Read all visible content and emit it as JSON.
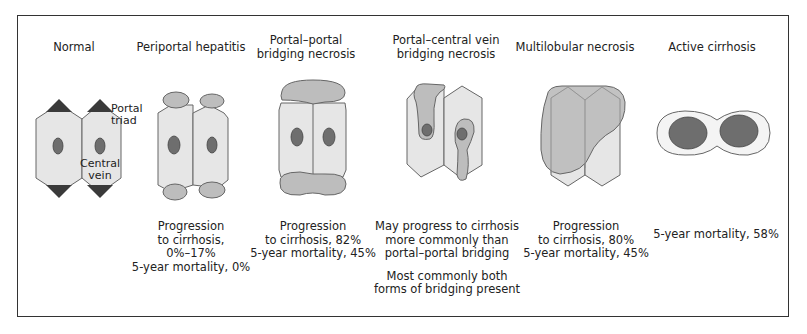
{
  "figure": {
    "stages": [
      {
        "id": "normal",
        "title": "Normal",
        "labels": {
          "portal_triad": "Portal\ntriad",
          "central_vein": "Central\nvein"
        },
        "caption": []
      },
      {
        "id": "periportal-hepatitis",
        "title": "Periportal hepatitis",
        "caption": [
          "Progression",
          "to cirrhosis,",
          "0%–17%",
          "5-year mortality, 0%"
        ]
      },
      {
        "id": "portal-portal-bridging-necrosis",
        "title": "Portal–portal\nbridging necrosis",
        "caption": [
          "Progression",
          "to cirrhosis, 82%",
          "5-year mortality, 45%"
        ]
      },
      {
        "id": "portal-central-vein-bridging-necrosis",
        "title": "Portal–central vein\nbridging necrosis",
        "caption": [
          "May progress to cirrhosis",
          "more commonly than",
          "portal–portal bridging",
          "",
          "Most commonly both",
          "forms of bridging present"
        ]
      },
      {
        "id": "multilobular-necrosis",
        "title": "Multilobular necrosis",
        "caption": [
          "Progression",
          "to cirrhosis, 80%",
          "5-year mortality, 45%"
        ]
      },
      {
        "id": "active-cirrhosis",
        "title": "Active cirrhosis",
        "caption": [
          "5-year mortality, 58%"
        ]
      }
    ],
    "colors": {
      "lobule_fill": "#e6e6e6",
      "lobule_stroke": "#666666",
      "necrosis_fill": "#bdbdbd",
      "vein_fill": "#6e6e6e",
      "triad_fill": "#3a3a3a",
      "frame_stroke": "#333333"
    }
  }
}
